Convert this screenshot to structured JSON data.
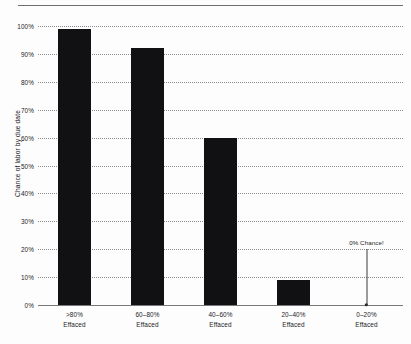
{
  "chart_data": {
    "type": "bar",
    "title": "",
    "xlabel": "",
    "ylabel": "Chance of labor by due date",
    "categories": [
      ">80%\nEffaced",
      "60-80%\nEffaced",
      "40-60%\nEffaced",
      "20-40%\nEffaced",
      "0-20%\nEffaced"
    ],
    "category_lines": [
      [
        ">80%",
        "Effaced"
      ],
      [
        "60–80%",
        "Effaced"
      ],
      [
        "40–60%",
        "Effaced"
      ],
      [
        "20–40%",
        "Effaced"
      ],
      [
        "0–20%",
        "Effaced"
      ]
    ],
    "values": [
      99,
      92,
      60,
      9,
      0
    ],
    "ylim": [
      0,
      100
    ],
    "ytick_labels": [
      "0%",
      "10%",
      "20%",
      "30%",
      "40%",
      "50%",
      "60%",
      "70%",
      "80%",
      "90%",
      "100%"
    ],
    "ytick_values": [
      0,
      10,
      20,
      30,
      40,
      50,
      60,
      70,
      80,
      90,
      100
    ],
    "grid": true,
    "legend": false,
    "bar_color": "#111113",
    "grid_color": "#8a8a8f",
    "axis_color": "#77777c",
    "text_color": "#1c1c1e",
    "annotations": [
      {
        "text": "0% Chance!",
        "category_index": 4,
        "value": 0
      }
    ]
  }
}
